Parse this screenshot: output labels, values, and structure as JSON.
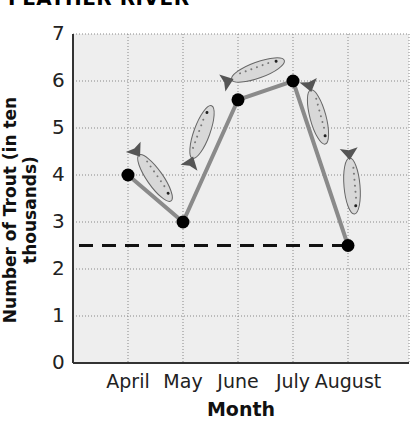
{
  "title": "FEATHER RIVER",
  "chart_data": {
    "type": "line",
    "title": "FEATHER RIVER",
    "xlabel": "Month",
    "ylabel": "Number of Trout (in ten thousands)",
    "categories": [
      "April",
      "May",
      "June",
      "July",
      "August"
    ],
    "values": [
      4,
      3,
      5.6,
      6,
      2.5
    ],
    "ylim": [
      0,
      7
    ],
    "yticks": [
      "0",
      "1",
      "2",
      "3",
      "4",
      "5",
      "6",
      "7"
    ],
    "grid": true,
    "annotations": [
      {
        "type": "dashed-hline",
        "y": 2.5,
        "from": "left-edge",
        "to": "August"
      }
    ],
    "decorations": "fish illustrations along line segments",
    "line_color": "#8a8a8a",
    "marker_color": "#000000"
  }
}
